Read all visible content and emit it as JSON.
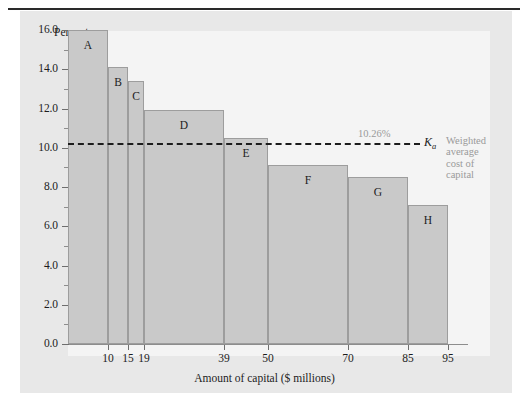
{
  "figure": {
    "background_color": "#e8e8e8",
    "plot_background_color": "#f4f4f4",
    "bar_fill_color": "#c9c9c9",
    "bar_border_color": "#9d9d9d",
    "axis_color": "#8d8d8d",
    "annotation_color": "#9a9a9a"
  },
  "annotation": {
    "wacc_value_label": "10.26%",
    "wacc_symbol": "K",
    "wacc_symbol_sub": "a",
    "caption_line_1": "Weighted",
    "caption_line_2": "average",
    "caption_line_3": "cost of",
    "caption_line_4": "capital"
  },
  "chart_data": {
    "type": "bar",
    "title": "",
    "subtitle": "",
    "xlabel": "Amount of capital ($ millions)",
    "ylabel": "Percent",
    "xlim": [
      0,
      100
    ],
    "ylim": [
      0,
      16
    ],
    "grid": false,
    "legend_position": "none",
    "y_ticks": [
      0.0,
      2.0,
      4.0,
      6.0,
      8.0,
      10.0,
      12.0,
      14.0,
      16.0
    ],
    "y_tick_labels": [
      "0.0",
      "2.0",
      "4.0",
      "6.0",
      "8.0",
      "10.0",
      "12.0",
      "14.0",
      "16.0"
    ],
    "y_minor_ticks": [
      1.0,
      3.0,
      5.0,
      7.0,
      9.0,
      11.0,
      13.0,
      15.0
    ],
    "x_ticks": [
      10,
      15,
      19,
      39,
      50,
      70,
      85,
      95
    ],
    "x_tick_labels": [
      "10",
      "15",
      "19",
      "39",
      "50",
      "70",
      "85",
      "95"
    ],
    "bars": [
      {
        "label": "A",
        "x_start": 0,
        "x_end": 10,
        "value": 16.0
      },
      {
        "label": "B",
        "x_start": 10,
        "x_end": 15,
        "value": 14.1
      },
      {
        "label": "C",
        "x_start": 15,
        "x_end": 19,
        "value": 13.4
      },
      {
        "label": "D",
        "x_start": 19,
        "x_end": 39,
        "value": 11.9
      },
      {
        "label": "E",
        "x_start": 39,
        "x_end": 50,
        "value": 10.5
      },
      {
        "label": "F",
        "x_start": 50,
        "x_end": 70,
        "value": 9.1
      },
      {
        "label": "G",
        "x_start": 70,
        "x_end": 85,
        "value": 8.5
      },
      {
        "label": "H",
        "x_start": 85,
        "x_end": 95,
        "value": 7.1
      }
    ],
    "annotations": [
      {
        "name": "wacc",
        "type": "hline",
        "y": 10.26,
        "label": "10.26%",
        "symbol": "Ka",
        "style": "dashed"
      }
    ]
  }
}
